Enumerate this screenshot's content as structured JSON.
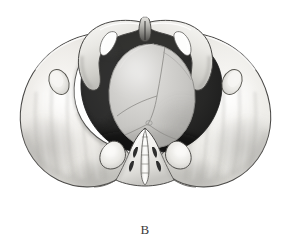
{
  "figure": {
    "label": "B",
    "caption_position": "bottom-center",
    "background_color": "#ffffff",
    "width": 290,
    "height": 247,
    "view": "superior (inlet) view"
  },
  "colors": {
    "background": "#ffffff",
    "bone_light": "#f2f1ef",
    "bone_mid": "#dededa",
    "bone_shadow": "#b9b8b4",
    "bone_deep_shadow": "#9a9995",
    "outline": "#3c3b39",
    "outline_soft": "#6e6d6a",
    "pelvic_cavity_dark": "#262626",
    "pelvic_cavity_dark2": "#1c1c1c",
    "fetal_head_light": "#d6d5d3",
    "fetal_head_mid": "#c2c1bf",
    "fetal_head_shadow": "#a6a5a2",
    "suture_line": "#8e8d8a",
    "foramen_white": "#fdfdfc",
    "sacrum_white": "#f6f5f3",
    "sacral_foramen": "#2e2e2e",
    "label_text": "#3a3a3a"
  },
  "structures": [
    {
      "id": "right-iliac-wing",
      "name": "Right iliac wing (ala of ilium)",
      "side": "image-left"
    },
    {
      "id": "left-iliac-wing",
      "name": "Left iliac wing (ala of ilium)",
      "side": "image-right"
    },
    {
      "id": "pubic-symphysis",
      "name": "Pubic symphysis",
      "side": "anterior-midline"
    },
    {
      "id": "right-superior-pubic-ramus",
      "name": "Right superior pubic ramus",
      "side": "image-left"
    },
    {
      "id": "left-superior-pubic-ramus",
      "name": "Left superior pubic ramus",
      "side": "image-right"
    },
    {
      "id": "right-obturator-foramen",
      "name": "Right obturator foramen",
      "side": "image-left"
    },
    {
      "id": "left-obturator-foramen",
      "name": "Left obturator foramen",
      "side": "image-right"
    },
    {
      "id": "right-acetabulum-rim",
      "name": "Right acetabular rim",
      "side": "image-left"
    },
    {
      "id": "left-acetabulum-rim",
      "name": "Left acetabular rim",
      "side": "image-right"
    },
    {
      "id": "right-ischial-spine",
      "name": "Right ischial spine",
      "side": "image-left"
    },
    {
      "id": "left-ischial-spine",
      "name": "Left ischial spine",
      "side": "image-right"
    },
    {
      "id": "sacrum",
      "name": "Sacrum with median sacral crest",
      "side": "posterior-midline"
    },
    {
      "id": "sacral-promontory",
      "name": "Sacral promontory",
      "side": "posterior-midline"
    },
    {
      "id": "pelvic-cavity",
      "name": "Pelvic cavity / true pelvis shadow",
      "side": "central"
    },
    {
      "id": "fetal-head",
      "name": "Fetal head (vertex) engaged in inlet",
      "side": "central"
    },
    {
      "id": "sagittal-suture",
      "name": "Sagittal suture",
      "side": "central"
    },
    {
      "id": "lambdoid-suture-right",
      "name": "Right lambdoid suture",
      "side": "central"
    },
    {
      "id": "lambdoid-suture-left",
      "name": "Left lambdoid suture",
      "side": "central"
    },
    {
      "id": "coronal-suture",
      "name": "Coronal suture",
      "side": "central"
    },
    {
      "id": "posterior-fontanelle",
      "name": "Posterior fontanelle",
      "side": "central"
    }
  ],
  "sacral_foramina": {
    "name": "Posterior sacral foramina",
    "pairs_visible": 2
  }
}
